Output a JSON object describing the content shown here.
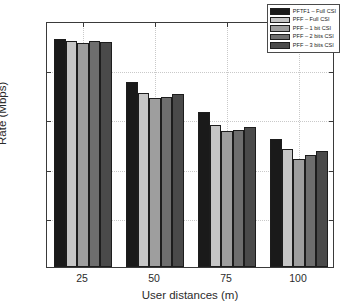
{
  "chart_data": {
    "type": "bar",
    "title": "",
    "xlabel": "User distances (m)",
    "ylabel": "Rate (Mbps)",
    "categories": [
      "25",
      "50",
      "75",
      "100"
    ],
    "series": [
      {
        "name": "PFTF1 – Full CSI",
        "color": "#1a1a1a",
        "values": [
          23.2,
          18.8,
          15.8,
          13.0
        ]
      },
      {
        "name": "PFF – Full CSI",
        "color": "#c6c6c6",
        "values": [
          23.0,
          17.7,
          14.4,
          12.0
        ]
      },
      {
        "name": "PFF – 1 bit CSI",
        "color": "#9e9e9e",
        "values": [
          22.8,
          17.2,
          13.8,
          11.0
        ]
      },
      {
        "name": "PFF – 2 bits CSI",
        "color": "#6e6e6e",
        "values": [
          23.0,
          17.3,
          13.9,
          11.4
        ]
      },
      {
        "name": "PFF – 3 bits CSI",
        "color": "#4a4a4a",
        "values": [
          22.9,
          17.6,
          14.2,
          11.8
        ]
      }
    ],
    "ylim": [
      0,
      25
    ],
    "yticks": [
      "0",
      "5",
      "10",
      "15",
      "20",
      "25"
    ],
    "ytick_values": [
      0,
      5,
      10,
      15,
      20,
      25
    ],
    "xticks": [
      "25",
      "50",
      "75",
      "100"
    ],
    "grid": true,
    "legend_position": "top-right",
    "axes_color": "#3a3a3a",
    "grid_color": "#c9c9c9",
    "background": "#ffffff"
  },
  "legend": {
    "entries": [
      "PFTF1 – Full CSI",
      "PFF – Full CSI",
      "PFF – 1 bit CSI",
      "PFF – 2 bits CSI",
      "PFF – 3 bits CSI"
    ]
  }
}
